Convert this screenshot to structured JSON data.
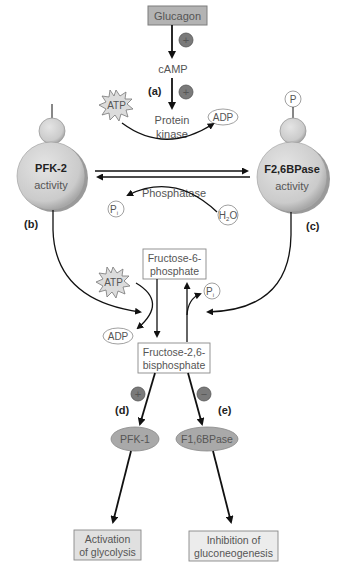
{
  "colors": {
    "box_fill": "#b3b3b3",
    "box_stroke": "#8a8a8a",
    "light_box_fill": "#e8e8e8",
    "white_box_fill": "#ffffff",
    "enzyme_fill": "#cfcfcf",
    "enzyme_shadow": "#9a9a9a",
    "oval_fill": "#a9a9a9",
    "sign_fill": "#7a7a7a",
    "text": "#555555",
    "arrow": "#111111"
  },
  "nodes": {
    "glucagon": "Glucagon",
    "camp": "cAMP",
    "protein_kinase_1": "Protein",
    "protein_kinase_2": "kinase",
    "phosphatase": "Phosphatase",
    "pfk2_title": "PFK-2",
    "pfk2_sub": "activity",
    "f26bpase_title": "F2,6BPase",
    "f26bpase_sub": "activity",
    "phosphate_tag": "P",
    "atp_top": "ATP",
    "adp_top": "ADP",
    "pi_top": "P",
    "pi_top_sub": "i",
    "h2o_h": "H",
    "h2o_sub": "2",
    "h2o_o": "O",
    "f6p_1": "Fructose-6-",
    "f6p_2": "phosphate",
    "f26bp_1": "Fructose-2,6-",
    "f26bp_2": "bisphosphate",
    "atp_mid": "ATP",
    "adp_mid": "ADP",
    "pi_mid": "P",
    "pi_mid_sub": "i",
    "pfk1": "PFK-1",
    "f16bpase": "F1,6BPase",
    "activation_1": "Activation",
    "activation_2": "of glycolysis",
    "inhibition_1": "Inhibition of",
    "inhibition_2": "gluconeogenesis"
  },
  "labels": {
    "a": "(a)",
    "b": "(b)",
    "c": "(c)",
    "d": "(d)",
    "e": "(e)"
  },
  "signs": {
    "glucagon_camp": "+",
    "camp_kinase": "+",
    "pfk1": "+",
    "f16bpase": "−"
  }
}
